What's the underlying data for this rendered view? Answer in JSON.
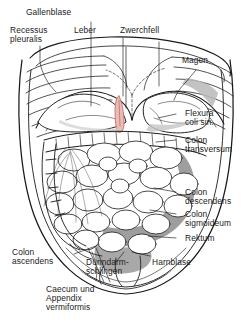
{
  "figure": {
    "language": "de",
    "style": "line-drawing",
    "background_color": "#ffffff",
    "line_color": "#1a1a1a",
    "shade_color": "#9a9a9a",
    "organ_accent_color": "#c4625a"
  },
  "labels": {
    "gallenblase": "Gallenblase",
    "recessus_pleuralis_l1": "Recessus",
    "recessus_pleuralis_l2": "pleuralis",
    "leber": "Leber",
    "zwerchfell": "Zwerchfell",
    "magen": "Magen",
    "flexura_l1": "Flexura",
    "flexura_l2": "coli sin.",
    "colon_transversum_l1": "Colon",
    "colon_transversum_l2": "transversum",
    "colon_descendens_l1": "Colon",
    "colon_descendens_l2": "descendens",
    "colon_sigmoideum_l1": "Colon",
    "colon_sigmoideum_l2": "sigmoideum",
    "rektum": "Rektum",
    "harnblase": "Harnblase",
    "duenndarm_l1": "Dünndarm-",
    "duenndarm_l2": "schlingen",
    "colon_ascendens_l1": "Colon",
    "colon_ascendens_l2": "ascendens",
    "caecum_l1": "Caecum und",
    "caecum_l2": "Appendix",
    "caecum_l3": "vermiformis"
  },
  "structures": [
    {
      "name": "gallbladder",
      "label": "Gallenblase"
    },
    {
      "name": "pleural-recess",
      "label": "Recessus pleuralis"
    },
    {
      "name": "liver",
      "label": "Leber"
    },
    {
      "name": "diaphragm",
      "label": "Zwerchfell"
    },
    {
      "name": "stomach",
      "label": "Magen"
    },
    {
      "name": "left-colic-flexure",
      "label": "Flexura coli sin."
    },
    {
      "name": "transverse-colon",
      "label": "Colon transversum"
    },
    {
      "name": "descending-colon",
      "label": "Colon descendens"
    },
    {
      "name": "sigmoid-colon",
      "label": "Colon sigmoideum"
    },
    {
      "name": "rectum",
      "label": "Rektum"
    },
    {
      "name": "urinary-bladder",
      "label": "Harnblase"
    },
    {
      "name": "small-intestine-loops",
      "label": "Dünndarmschlingen"
    },
    {
      "name": "ascending-colon",
      "label": "Colon ascendens"
    },
    {
      "name": "caecum-appendix",
      "label": "Caecum und Appendix vermiformis"
    }
  ]
}
